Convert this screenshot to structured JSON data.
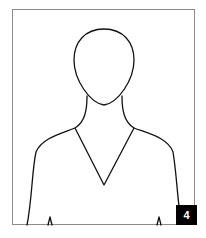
{
  "illustration": {
    "subject": "person-silhouette-outline",
    "frame_color": "#8a8a8a",
    "line_color": "#111111"
  },
  "badge": {
    "label": "4",
    "background": "#000000",
    "text_color": "#ffffff"
  }
}
